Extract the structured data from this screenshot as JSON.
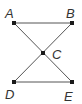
{
  "diagram": {
    "type": "geometry",
    "points": {
      "A": {
        "label": "A",
        "x": 14,
        "y": 23,
        "lx": 5,
        "ly": 18
      },
      "B": {
        "label": "B",
        "x": 72,
        "y": 23,
        "lx": 66,
        "ly": 18
      },
      "C": {
        "label": "C",
        "x": 43,
        "y": 53,
        "lx": 52,
        "ly": 59
      },
      "D": {
        "label": "D",
        "x": 14,
        "y": 82,
        "lx": 5,
        "ly": 99
      },
      "E": {
        "label": "E",
        "x": 72,
        "y": 82,
        "lx": 64,
        "ly": 101
      }
    },
    "segments": [
      [
        "A",
        "B"
      ],
      [
        "D",
        "E"
      ],
      [
        "A",
        "E"
      ],
      [
        "B",
        "D"
      ]
    ],
    "colors": {
      "line": "#555555",
      "point": "#1a1a1a",
      "label": "#333333"
    }
  }
}
